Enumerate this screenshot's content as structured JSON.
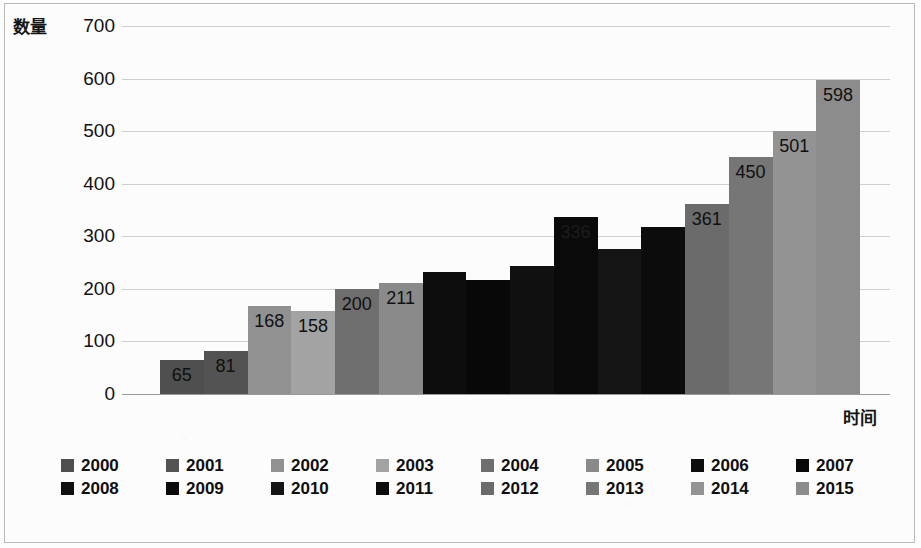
{
  "chart_data": {
    "type": "bar",
    "title": "",
    "subtitle": "",
    "xlabel": "时间",
    "ylabel": "数量",
    "categories": [
      "2000",
      "2001",
      "2002",
      "2003",
      "2004",
      "2005",
      "2006",
      "2007",
      "2008",
      "2009",
      "2010",
      "2011",
      "2012",
      "2013",
      "2014",
      "2015"
    ],
    "values": [
      65,
      81,
      168,
      158,
      200,
      211,
      233,
      216,
      244,
      336,
      275,
      318,
      361,
      450,
      501,
      598
    ],
    "data_labels": [
      "65",
      "81",
      "168",
      "158",
      "200",
      "211",
      "",
      "",
      "",
      "336",
      "",
      "",
      "361",
      "450",
      "501",
      "598"
    ],
    "bar_colors": [
      "#4f4f4f",
      "#535353",
      "#919191",
      "#a3a3a3",
      "#6e6e6e",
      "#8a8a8a",
      "#0d0d0d",
      "#080808",
      "#101010",
      "#0a0a0a",
      "#151515",
      "#0c0c0c",
      "#6b6b6b",
      "#767676",
      "#939393",
      "#8c8c8c"
    ],
    "label_colors": [
      "#101010",
      "#101010",
      "#101010",
      "#101010",
      "#101010",
      "#101010",
      "#101010",
      "#101010",
      "#101010",
      "#1c1c1c",
      "#101010",
      "#101010",
      "#101010",
      "#101010",
      "#101010",
      "#101010"
    ],
    "ylim": [
      0,
      700
    ],
    "ytick_labels": [
      "0",
      "100",
      "200",
      "300",
      "400",
      "500",
      "600",
      "700"
    ],
    "ytick_values": [
      0,
      100,
      200,
      300,
      400,
      500,
      600,
      700
    ],
    "grid": true,
    "legend_position": "bottom"
  },
  "legend": {
    "rows": [
      [
        {
          "label": "2000",
          "color": "#4f4f4f"
        },
        {
          "label": "2001",
          "color": "#535353"
        },
        {
          "label": "2002",
          "color": "#919191"
        },
        {
          "label": "2003",
          "color": "#a3a3a3"
        },
        {
          "label": "2004",
          "color": "#6e6e6e"
        },
        {
          "label": "2005",
          "color": "#8a8a8a"
        },
        {
          "label": "2006",
          "color": "#0d0d0d"
        },
        {
          "label": "2007",
          "color": "#080808"
        }
      ],
      [
        {
          "label": "2008",
          "color": "#101010"
        },
        {
          "label": "2009",
          "color": "#0a0a0a"
        },
        {
          "label": "2010",
          "color": "#151515"
        },
        {
          "label": "2011",
          "color": "#0c0c0c"
        },
        {
          "label": "2012",
          "color": "#6b6b6b"
        },
        {
          "label": "2013",
          "color": "#767676"
        },
        {
          "label": "2014",
          "color": "#939393"
        },
        {
          "label": "2015",
          "color": "#8c8c8c"
        }
      ]
    ]
  }
}
